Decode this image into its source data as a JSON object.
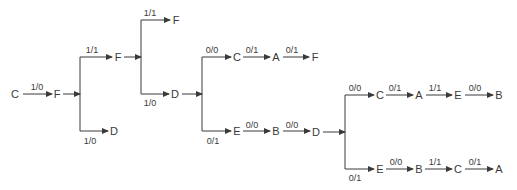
{
  "diagram": {
    "type": "state-transition-tree",
    "nodes": [
      {
        "id": "n1",
        "label": "C",
        "x": 15,
        "y": 94
      },
      {
        "id": "n2",
        "label": "F",
        "x": 57,
        "y": 94
      },
      {
        "id": "n3",
        "label": "F",
        "x": 118,
        "y": 57
      },
      {
        "id": "n4",
        "label": "D",
        "x": 114,
        "y": 131
      },
      {
        "id": "n5",
        "label": "F",
        "x": 176,
        "y": 20
      },
      {
        "id": "n6",
        "label": "D",
        "x": 175,
        "y": 94
      },
      {
        "id": "n7",
        "label": "C",
        "x": 237,
        "y": 57
      },
      {
        "id": "n8",
        "label": "A",
        "x": 276,
        "y": 57
      },
      {
        "id": "n9",
        "label": "F",
        "x": 315,
        "y": 57
      },
      {
        "id": "n10",
        "label": "E",
        "x": 237,
        "y": 131
      },
      {
        "id": "n11",
        "label": "B",
        "x": 276,
        "y": 131
      },
      {
        "id": "n12",
        "label": "D",
        "x": 316,
        "y": 132
      },
      {
        "id": "n13",
        "label": "C",
        "x": 380,
        "y": 95
      },
      {
        "id": "n14",
        "label": "A",
        "x": 419,
        "y": 95
      },
      {
        "id": "n15",
        "label": "E",
        "x": 458,
        "y": 95
      },
      {
        "id": "n16",
        "label": "B",
        "x": 499,
        "y": 95
      },
      {
        "id": "n17",
        "label": "E",
        "x": 380,
        "y": 169
      },
      {
        "id": "n18",
        "label": "B",
        "x": 419,
        "y": 169
      },
      {
        "id": "n19",
        "label": "C",
        "x": 458,
        "y": 169
      },
      {
        "id": "n20",
        "label": "A",
        "x": 499,
        "y": 169
      }
    ],
    "splits": [
      {
        "from_x": 63,
        "y": 94,
        "bar_x": 80,
        "top_y": 57,
        "bottom_y": 131
      },
      {
        "from_x": 124,
        "y": 57,
        "bar_x": 141,
        "top_y": 20,
        "bottom_y": 94
      },
      {
        "from_x": 182,
        "y": 94,
        "bar_x": 202,
        "top_y": 57,
        "bottom_y": 131
      },
      {
        "from_x": 323,
        "y": 132,
        "bar_x": 345,
        "top_y": 95,
        "bottom_y": 169
      }
    ],
    "edges": [
      {
        "x1": 23,
        "x2": 52,
        "y": 94,
        "label": "1/0",
        "lx": 37,
        "ly": 87,
        "arrow": true
      },
      {
        "x1": 80,
        "x2": 112,
        "y": 57,
        "label": "1/1",
        "lx": 92,
        "ly": 50,
        "arrow": true
      },
      {
        "x1": 80,
        "x2": 108,
        "y": 131,
        "label": "1/0",
        "lx": 90,
        "ly": 141,
        "arrow": true
      },
      {
        "x1": 141,
        "x2": 170,
        "y": 20,
        "label": "1/1",
        "lx": 150,
        "ly": 13,
        "arrow": true
      },
      {
        "x1": 141,
        "x2": 169,
        "y": 94,
        "label": "1/0",
        "lx": 150,
        "ly": 103,
        "arrow": true
      },
      {
        "x1": 202,
        "x2": 231,
        "y": 57,
        "label": "0/0",
        "lx": 212,
        "ly": 50,
        "arrow": true
      },
      {
        "x1": 243,
        "x2": 270,
        "y": 57,
        "label": "0/1",
        "lx": 252,
        "ly": 50,
        "arrow": true
      },
      {
        "x1": 283,
        "x2": 309,
        "y": 57,
        "label": "0/1",
        "lx": 292,
        "ly": 50,
        "arrow": true
      },
      {
        "x1": 202,
        "x2": 231,
        "y": 131,
        "label": "0/1",
        "lx": 213,
        "ly": 141,
        "arrow": true
      },
      {
        "x1": 243,
        "x2": 270,
        "y": 131,
        "label": "0/0",
        "lx": 252,
        "ly": 125,
        "arrow": true
      },
      {
        "x1": 283,
        "x2": 310,
        "y": 131,
        "label": "0/0",
        "lx": 292,
        "ly": 125,
        "arrow": true
      },
      {
        "x1": 345,
        "x2": 374,
        "y": 95,
        "label": "0/0",
        "lx": 355,
        "ly": 88,
        "arrow": true
      },
      {
        "x1": 386,
        "x2": 413,
        "y": 95,
        "label": "0/1",
        "lx": 395,
        "ly": 88,
        "arrow": true
      },
      {
        "x1": 426,
        "x2": 452,
        "y": 95,
        "label": "1/1",
        "lx": 435,
        "ly": 88,
        "arrow": true
      },
      {
        "x1": 465,
        "x2": 493,
        "y": 95,
        "label": "0/0",
        "lx": 475,
        "ly": 88,
        "arrow": true
      },
      {
        "x1": 345,
        "x2": 374,
        "y": 169,
        "label": "0/1",
        "lx": 355,
        "ly": 178,
        "arrow": true
      },
      {
        "x1": 386,
        "x2": 413,
        "y": 169,
        "label": "0/0",
        "lx": 396,
        "ly": 162,
        "arrow": true
      },
      {
        "x1": 425,
        "x2": 452,
        "y": 169,
        "label": "1/1",
        "lx": 435,
        "ly": 162,
        "arrow": true
      },
      {
        "x1": 465,
        "x2": 493,
        "y": 169,
        "label": "0/1",
        "lx": 475,
        "ly": 162,
        "arrow": true
      }
    ]
  }
}
